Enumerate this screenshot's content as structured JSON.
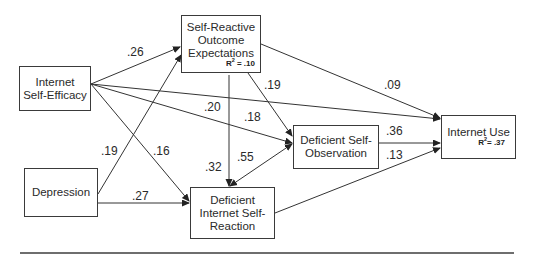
{
  "diagram": {
    "type": "path-model",
    "nodes": [
      {
        "id": "ise",
        "label": "Internet\nSelf-Efficacy"
      },
      {
        "id": "sroe",
        "label": "Self-Reactive\nOutcome\nExpectations",
        "r2": "R² = .10",
        "r2_base": "R",
        "r2_sup": "2",
        "r2_val": " = .10"
      },
      {
        "id": "dep",
        "label": "Depression"
      },
      {
        "id": "disr",
        "label": "Deficient\nInternet Self-\nReaction"
      },
      {
        "id": "dso",
        "label": "Deficient Self-\nObservation"
      },
      {
        "id": "iu",
        "label": "Internet Use",
        "r2": "R² = .37",
        "r2_base": "R",
        "r2_sup": "2",
        "r2_val": "= .37"
      }
    ],
    "edges": [
      {
        "from": "ise",
        "to": "sroe",
        "coef": ".26"
      },
      {
        "from": "ise",
        "to": "iu",
        "coef": ".20"
      },
      {
        "from": "ise",
        "to": "dso",
        "coef": ".18"
      },
      {
        "from": "ise",
        "to": "disr",
        "coef": ".16"
      },
      {
        "from": "dep",
        "to": "sroe",
        "coef": ".19"
      },
      {
        "from": "dep",
        "to": "disr",
        "coef": ".27"
      },
      {
        "from": "sroe",
        "to": "iu",
        "coef": ".09"
      },
      {
        "from": "sroe",
        "to": "dso",
        "coef": ".19"
      },
      {
        "from": "sroe",
        "to": "disr",
        "coef": ".32"
      },
      {
        "from": "disr",
        "to": "dso",
        "coef": ".55",
        "bidirectional": true
      },
      {
        "from": "dso",
        "to": "iu",
        "coef": ".36"
      },
      {
        "from": "disr",
        "to": "iu",
        "coef": ".13"
      }
    ],
    "colors": {
      "line": "#333333",
      "border": "#3a3a3a",
      "rule": "#6e6e6e"
    }
  }
}
